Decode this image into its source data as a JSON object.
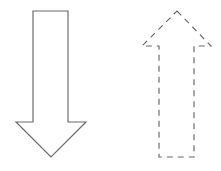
{
  "diagram": {
    "title": "",
    "shapes": [
      {
        "id": "down-arrow",
        "kind": "block-arrow",
        "direction": "down",
        "line_style": "solid",
        "stroke": "#6b6b6b",
        "fill": "#ffffff"
      },
      {
        "id": "up-arrow",
        "kind": "block-arrow",
        "direction": "up",
        "line_style": "dashed",
        "stroke": "#6b6b6b",
        "fill": "#ffffff"
      }
    ]
  }
}
